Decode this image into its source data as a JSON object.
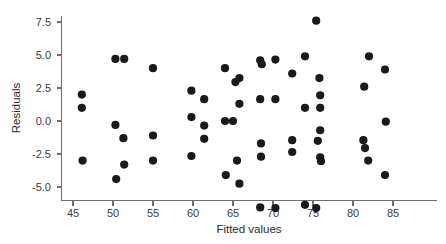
{
  "chart_data": {
    "type": "scatter",
    "title": "",
    "subtitle": "",
    "xlabel": "Fitted values",
    "ylabel": "Residuals",
    "xlim": [
      43.5,
      86.5
    ],
    "ylim": [
      -7.6,
      8.4
    ],
    "xticks": [
      45,
      50,
      55,
      60,
      65,
      70,
      75,
      80,
      85
    ],
    "xticklabels": [
      "45",
      "50",
      "55",
      "60",
      "65",
      "70",
      "75",
      "80",
      "85"
    ],
    "yticks": [
      7.5,
      5.0,
      2.5,
      0.0,
      -2.5,
      -5.0
    ],
    "yticklabels": [
      "7.5",
      "5.0",
      "2.5",
      "0.0",
      "-2.5",
      "-5.0"
    ],
    "grid": false,
    "legend": null,
    "marker": "circle",
    "marker_color": "#1a1a1a",
    "marker_size": 4.1,
    "series": [
      {
        "name": "residuals",
        "points": [
          [
            46.1,
            2.0
          ],
          [
            46.1,
            1.0
          ],
          [
            46.2,
            -3.0
          ],
          [
            50.3,
            4.7
          ],
          [
            51.4,
            4.7
          ],
          [
            50.3,
            -0.3
          ],
          [
            51.3,
            -1.3
          ],
          [
            50.4,
            -4.4
          ],
          [
            51.4,
            -3.3
          ],
          [
            55.0,
            4.0
          ],
          [
            55.0,
            -1.1
          ],
          [
            55.0,
            -3.0
          ],
          [
            59.8,
            2.3
          ],
          [
            59.8,
            0.3
          ],
          [
            59.8,
            -2.65
          ],
          [
            61.4,
            1.65
          ],
          [
            61.4,
            -0.35
          ],
          [
            61.4,
            -1.35
          ],
          [
            64.0,
            4.0
          ],
          [
            64.0,
            0.0
          ],
          [
            65.0,
            0.0
          ],
          [
            64.1,
            -4.1
          ],
          [
            65.3,
            2.95
          ],
          [
            65.8,
            3.25
          ],
          [
            65.8,
            1.3
          ],
          [
            65.5,
            -3.0
          ],
          [
            65.8,
            -4.75
          ],
          [
            68.4,
            4.6
          ],
          [
            68.6,
            4.3
          ],
          [
            70.3,
            4.65
          ],
          [
            68.4,
            1.65
          ],
          [
            70.3,
            1.65
          ],
          [
            68.5,
            -1.7
          ],
          [
            68.5,
            -2.7
          ],
          [
            68.4,
            -6.55
          ],
          [
            70.3,
            -6.6
          ],
          [
            72.4,
            3.6
          ],
          [
            72.4,
            -1.45
          ],
          [
            72.4,
            -2.35
          ],
          [
            74.0,
            4.9
          ],
          [
            74.0,
            1.0
          ],
          [
            74.0,
            -6.35
          ],
          [
            75.4,
            7.6
          ],
          [
            75.8,
            3.25
          ],
          [
            75.9,
            1.95
          ],
          [
            75.9,
            1.0
          ],
          [
            75.9,
            -0.7
          ],
          [
            75.6,
            -1.5
          ],
          [
            75.9,
            -2.75
          ],
          [
            76.0,
            -3.05
          ],
          [
            75.4,
            -6.6
          ],
          [
            81.4,
            2.6
          ],
          [
            82.0,
            4.9
          ],
          [
            81.3,
            -1.45
          ],
          [
            81.5,
            -2.05
          ],
          [
            81.9,
            -3.0
          ],
          [
            84.0,
            3.9
          ],
          [
            84.1,
            -0.05
          ],
          [
            84.0,
            -4.1
          ]
        ]
      }
    ]
  },
  "axes": {
    "x_axis_title": "Fitted values",
    "y_axis_title": "Residuals"
  },
  "colors": {
    "background": "#ffffff",
    "marker": "#1a1a1a",
    "spine": "#6e6e6e",
    "tick_text": "#3c3c3c"
  }
}
